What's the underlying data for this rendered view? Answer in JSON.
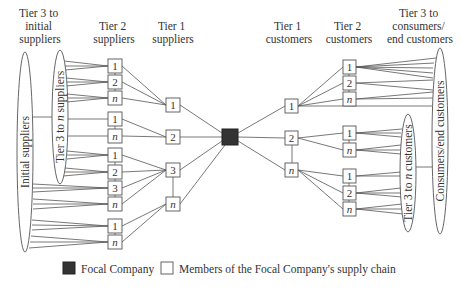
{
  "headers": {
    "tier3_suppliers": [
      "Tier 3 to",
      "initial",
      "suppliers"
    ],
    "tier2_suppliers": [
      "Tier 2",
      "suppliers"
    ],
    "tier1_suppliers": [
      "Tier 1",
      "suppliers"
    ],
    "tier1_customers": [
      "Tier 1",
      "customers"
    ],
    "tier2_customers": [
      "Tier 2",
      "customers"
    ],
    "tier3_customers": [
      "Tier 3 to",
      "consumers/",
      "end customers"
    ]
  },
  "ellipses": {
    "initial_suppliers": "Initial suppliers",
    "tier3_to_n_suppliers_pre": "Tier 3 to ",
    "tier3_to_n_suppliers_n": "n",
    "tier3_to_n_suppliers_post": " suppliers",
    "consumers_end_customers": "Consumers/end customers",
    "tier3_to_n_customers_pre": "Tier 3 to ",
    "tier3_to_n_customers_n": "n",
    "tier3_to_n_customers_post": " customers"
  },
  "nodes": {
    "tier2_suppliers": [
      "1",
      "2",
      "n",
      "1",
      "n",
      "1",
      "2",
      "3",
      "n",
      "1",
      "n"
    ],
    "tier1_suppliers": [
      "1",
      "2",
      "3",
      "n"
    ],
    "tier1_customers": [
      "1",
      "2",
      "n"
    ],
    "tier2_customers": [
      "1",
      "2",
      "n",
      "1",
      "n",
      "1",
      "2",
      "n"
    ]
  },
  "legend": {
    "focal_company": "Focal Company",
    "members": "Members of the Focal Company's supply chain"
  },
  "colors": {
    "focal_fill": "#333333",
    "line": "#555555"
  }
}
